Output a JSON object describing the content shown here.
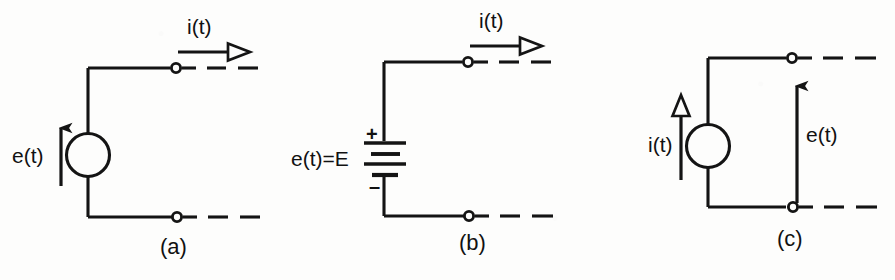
{
  "figure": {
    "kind": "circuit-diagram",
    "stroke_color": "#141414",
    "background_color": "#fdfdfc",
    "panels": [
      {
        "id": "a",
        "caption": "(a)",
        "source_type": "ideal-voltage-source",
        "symbol": "circle",
        "labels": {
          "current": "i(t)",
          "voltage": "e(t)"
        },
        "current_arrow": {
          "direction": "right",
          "head": "hollow",
          "position": "above-top-terminal"
        },
        "voltage_arrow": {
          "direction": "up",
          "head": "solid",
          "position": "left-of-circle"
        },
        "terminals": 2,
        "terminal_style": "open-circle-with-dashed-lead"
      },
      {
        "id": "b",
        "caption": "(b)",
        "source_type": "dc-battery-source",
        "symbol": "battery-multicell",
        "labels": {
          "current": "i(t)",
          "voltage": "e(t)=E",
          "plus": "+",
          "minus": "–"
        },
        "current_arrow": {
          "direction": "right",
          "head": "hollow",
          "position": "above-top-terminal"
        },
        "battery": {
          "cells": 2,
          "long_plates": 2,
          "short_plates": 2
        },
        "terminals": 2,
        "terminal_style": "open-circle-with-dashed-lead"
      },
      {
        "id": "c",
        "caption": "(c)",
        "source_type": "ideal-current-source",
        "symbol": "circle",
        "labels": {
          "current": "i(t)",
          "voltage": "e(t)"
        },
        "current_arrow": {
          "direction": "up",
          "head": "hollow",
          "position": "left-of-circle"
        },
        "voltage_arrow": {
          "direction": "up",
          "head": "solid",
          "position": "between-terminals"
        },
        "terminals": 2,
        "terminal_style": "open-circle-with-dashed-lead"
      }
    ]
  }
}
